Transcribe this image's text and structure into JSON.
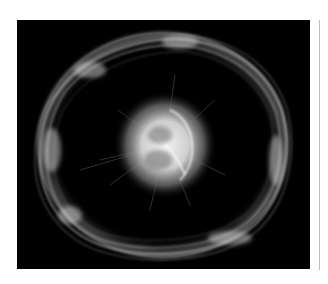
{
  "image": {
    "alt": "Fluorescence micrograph of a cell showing a bright central nucleus with radiating filaments surrounded by an irregular ring of cytoskeletal fibers on a black background",
    "background_color": "#000000",
    "page_background": "#ffffff",
    "divider_color": "#bdbdbd",
    "structures": [
      {
        "name": "outer-fiber-ring",
        "center": [
          163,
          145
        ],
        "radius_x": 125,
        "radius_y": 112
      },
      {
        "name": "central-nucleus",
        "center": [
          165,
          145
        ],
        "radius_x": 45,
        "radius_y": 48
      }
    ]
  }
}
